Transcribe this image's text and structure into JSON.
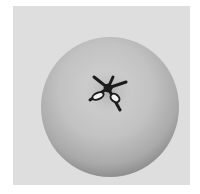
{
  "image": {
    "subject": "fruit-calyx-end-view",
    "description": "Grayscale photograph of a round fruit (apple or quince) seen from the blossom end, showing the five-pointed dried calyx",
    "colors": {
      "page_background": "#ffffff",
      "panel_background": "#dedede",
      "fruit_light": "#cfcfcf",
      "fruit_mid": "#b3b3b3",
      "fruit_shadow": "#8e8e8e",
      "calyx_dark": "#1c1c1c",
      "calyx_highlight": "#f2f2f2"
    }
  }
}
